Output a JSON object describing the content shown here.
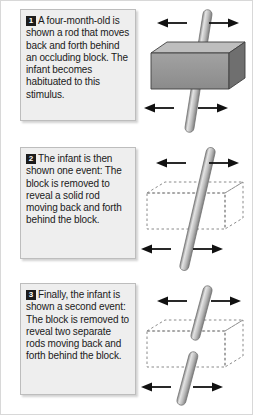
{
  "figure": {
    "background_color": "#ffffff",
    "border_color": "#d8d8d8"
  },
  "style": {
    "card_background": "#eeeeee",
    "card_border": "#bdbdbd",
    "badge_background": "#1c1c1c",
    "badge_text_color": "#ffffff",
    "text_color": "#1a1a1a",
    "rod_light": "#e6e6e6",
    "rod_mid": "#b4b4b4",
    "rod_dark": "#8a8a8a",
    "block_top": "#b9b9b9",
    "block_front": "#949494",
    "block_side": "#6e6e6e",
    "block_outline": "#3d3d3d",
    "arrow_color": "#111111",
    "dashed_outline": "#8a8a8a"
  },
  "panels": [
    {
      "number": "1",
      "caption": "A four-month-old is shown a rod that moves back and forth behind an occluding block. The infant becomes habituated to this stimulus.",
      "illustration": {
        "name": "solid-block-with-rod",
        "block_style": "solid",
        "rod_segments": 1,
        "arrows": [
          "left-arrow-top",
          "right-arrow-top",
          "left-arrow-bottom",
          "right-arrow-bottom"
        ]
      }
    },
    {
      "number": "2",
      "caption": "The infant is then shown one event: The block is removed to reveal a solid rod moving back and forth behind the block.",
      "illustration": {
        "name": "dashed-block-with-single-rod",
        "block_style": "dashed",
        "rod_segments": 1,
        "arrows": [
          "left-arrow-top",
          "right-arrow-top",
          "left-arrow-bottom",
          "right-arrow-bottom"
        ]
      }
    },
    {
      "number": "3",
      "caption": "Finally, the infant is shown a second event: The block is removed to reveal two separate rods moving back and forth behind the block.",
      "illustration": {
        "name": "dashed-block-with-two-rods",
        "block_style": "dashed",
        "rod_segments": 2,
        "arrows": [
          "left-arrow-top",
          "right-arrow-top",
          "left-arrow-bottom",
          "right-arrow-bottom"
        ]
      }
    }
  ]
}
